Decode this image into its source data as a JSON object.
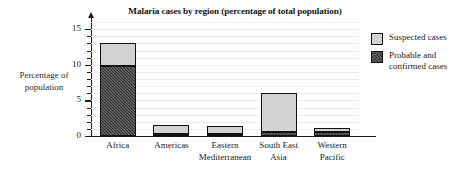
{
  "chart_data": {
    "type": "bar",
    "title": "Malaria cases by region (percentage of total population)",
    "xlabel": "",
    "ylabel": "Percentage of population",
    "ylim": [
      0,
      16
    ],
    "yticks": [
      0,
      5,
      10,
      15
    ],
    "ytick_labels": [
      "0",
      "5",
      "10",
      "15"
    ],
    "minor_tick_step": 1,
    "grid": true,
    "stacked": true,
    "legend_position": "right",
    "categories": [
      "Africa",
      "Americas",
      "Eastern Mediterranean",
      "South East Asia",
      "Western Pacific"
    ],
    "category_lines": [
      [
        "Africa"
      ],
      [
        "Americas"
      ],
      [
        "Eastern",
        "Mediterranean"
      ],
      [
        "South East",
        "Asia"
      ],
      [
        "Western",
        "Pacific"
      ]
    ],
    "series": [
      {
        "name": "Probable and confirmed cases",
        "color": "#4a4a4a",
        "pattern": "hatch",
        "values": [
          9.8,
          0.15,
          0.1,
          0.55,
          0.5
        ]
      },
      {
        "name": "Suspected cases",
        "color": "#d2d2d2",
        "pattern": "solid",
        "values": [
          3.2,
          1.35,
          1.2,
          5.55,
          0.6
        ]
      }
    ],
    "totals": [
      13.0,
      1.5,
      1.3,
      6.1,
      1.1
    ]
  },
  "legend": {
    "entries": [
      {
        "label": "Suspected cases",
        "lines": [
          "Suspected cases"
        ],
        "swatch": "#d2d2d2"
      },
      {
        "label": "Probable and confirmed cases",
        "lines": [
          "Probable and",
          "confirmed cases"
        ],
        "swatch": "#4a4a4a"
      }
    ]
  },
  "axis_label": {
    "y_line1": "Percentage of",
    "y_line2": "population"
  }
}
